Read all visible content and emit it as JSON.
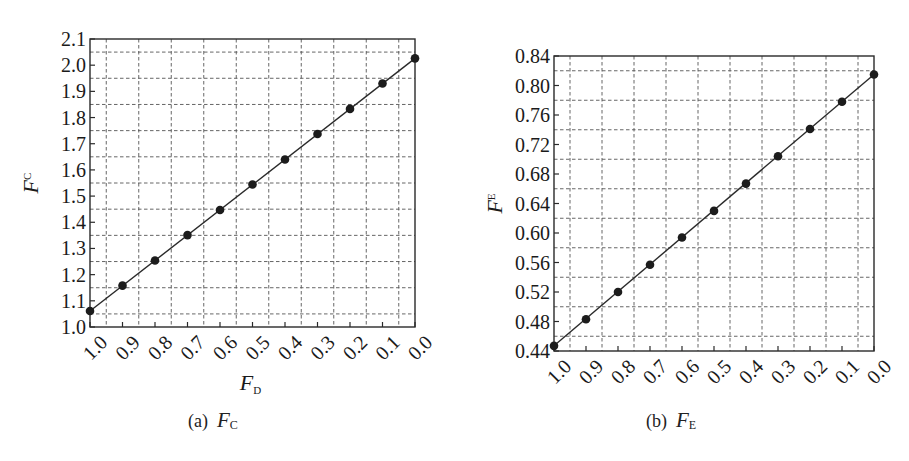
{
  "figure": {
    "background": "#ffffff",
    "ink_color": "#1c1c1c"
  },
  "chart_data": [
    {
      "id": "a",
      "type": "line",
      "caption_prefix": "(a)",
      "caption_var": "F",
      "caption_sub": "C",
      "title": "(a) F_C",
      "xlabel": "F_D",
      "xlabel_main": "F",
      "xlabel_sub": "D",
      "ylabel": "F_C",
      "ylabel_main": "F",
      "ylabel_sub": "C",
      "x_reversed": true,
      "xlim": [
        1.0,
        0.0
      ],
      "ylim": [
        1.0,
        2.1
      ],
      "x_ticks": [
        "1.0",
        "0.9",
        "0.8",
        "0.7",
        "0.6",
        "0.5",
        "0.4",
        "0.3",
        "0.2",
        "0.1",
        "0.0"
      ],
      "y_ticks": [
        "1.0",
        "1.1",
        "1.2",
        "1.3",
        "1.4",
        "1.5",
        "1.6",
        "1.7",
        "1.8",
        "1.9",
        "2.0",
        "2.1"
      ],
      "y_tick_step": 0.1,
      "grid": true,
      "grid_style": "dashed, at half-steps between major ticks",
      "legend": null,
      "series": [
        {
          "name": "F_C",
          "marker": "filled-circle",
          "line": "solid",
          "x": [
            1.0,
            0.9,
            0.8,
            0.7,
            0.6,
            0.5,
            0.4,
            0.3,
            0.2,
            0.1,
            0.0
          ],
          "values": [
            1.061,
            1.158,
            1.254,
            1.351,
            1.447,
            1.544,
            1.64,
            1.737,
            1.833,
            1.93,
            2.026
          ]
        }
      ],
      "frame_px": {
        "left": 90,
        "top": 39,
        "right": 415,
        "bottom": 327
      }
    },
    {
      "id": "b",
      "type": "line",
      "caption_prefix": "(b)",
      "caption_var": "F",
      "caption_sub": "E",
      "title": "(b) F_E",
      "xlabel": "",
      "xlabel_main": "",
      "xlabel_sub": "",
      "ylabel": "F_E",
      "ylabel_main": "F",
      "ylabel_sub": "E",
      "x_reversed": true,
      "xlim": [
        1.0,
        0.0
      ],
      "ylim": [
        0.44,
        0.84
      ],
      "x_ticks": [
        "1.0",
        "0.9",
        "0.8",
        "0.7",
        "0.6",
        "0.5",
        "0.4",
        "0.3",
        "0.2",
        "0.1",
        "0.0"
      ],
      "y_ticks": [
        "0.44",
        "0.48",
        "0.52",
        "0.56",
        "0.60",
        "0.64",
        "0.68",
        "0.72",
        "0.76",
        "0.80",
        "0.84"
      ],
      "y_tick_step": 0.04,
      "grid": true,
      "grid_style": "dashed, at half-steps between major ticks",
      "legend": null,
      "series": [
        {
          "name": "F_E",
          "marker": "filled-circle",
          "line": "solid",
          "x": [
            1.0,
            0.9,
            0.8,
            0.7,
            0.6,
            0.5,
            0.4,
            0.3,
            0.2,
            0.1,
            0.0
          ],
          "values": [
            0.447,
            0.483,
            0.52,
            0.557,
            0.594,
            0.63,
            0.667,
            0.704,
            0.741,
            0.778,
            0.815
          ]
        }
      ],
      "frame_px": {
        "left": 99,
        "top": 56,
        "right": 419,
        "bottom": 351
      }
    }
  ]
}
